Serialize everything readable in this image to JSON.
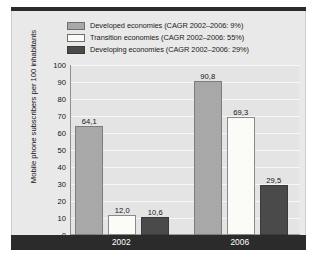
{
  "chart_data": {
    "type": "bar",
    "title": "",
    "xlabel": "",
    "ylabel": "Mobile phone subscribers per 100 inhabitants",
    "ylim": [
      0,
      100
    ],
    "yticks": [
      100,
      90,
      80,
      70,
      60,
      50,
      40,
      30,
      20,
      10,
      0
    ],
    "grid": true,
    "legend_position": "top",
    "decimal_separator": ",",
    "categories": [
      "2002",
      "2006"
    ],
    "series": [
      {
        "name": "Developed economies",
        "legend_label": "Developed economies (CAGR 2002–2006: 9%)",
        "cagr": "9%",
        "color": "#a8a8a8",
        "values": [
          64.1,
          90.8
        ],
        "value_labels": [
          "64,1",
          "90,8"
        ]
      },
      {
        "name": "Transition economies",
        "legend_label": "Transition economies (CAGR 2002–2006: 55%)",
        "cagr": "55%",
        "color": "#fbfbf8",
        "values": [
          12.0,
          69.3
        ],
        "value_labels": [
          "12,0",
          "69,3"
        ]
      },
      {
        "name": "Developing economies",
        "legend_label": "Developing economies (CAGR 2002–2006: 29%)",
        "cagr": "29%",
        "color": "#4a4a4a",
        "values": [
          10.6,
          29.5
        ],
        "value_labels": [
          "10,6",
          "29,5"
        ]
      }
    ]
  },
  "colors": {
    "panel_background": "#e9e9e9",
    "plot_background": "#e4e4e4",
    "gridline": "#f7f7f7",
    "band": "#2b2b2b",
    "text": "#141414"
  }
}
